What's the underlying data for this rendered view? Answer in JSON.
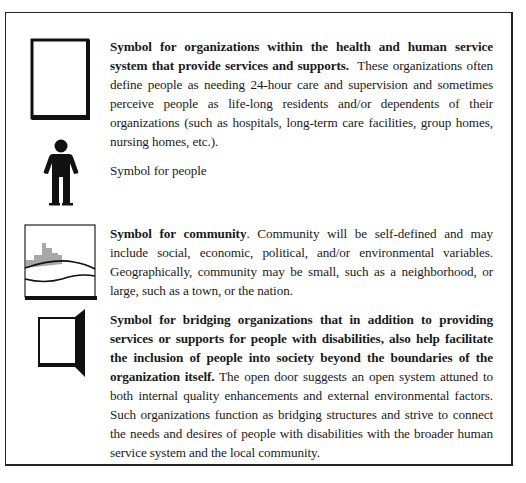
{
  "legend": {
    "entries": [
      {
        "id": "organizations",
        "icon": "organization-rectangle-icon",
        "bold": "Symbol for organizations within the health and human service system that provide services and supports.",
        "text": "  These organizations often define people as needing 24-hour care and supervision and sometimes perceive people as life-long residents and/or dependents of their organizations (such as hospitals, long-term care facilities, group homes, nursing homes, etc.)."
      },
      {
        "id": "people",
        "icon": "person-icon",
        "bold": "",
        "text": "Symbol for people"
      },
      {
        "id": "community",
        "icon": "community-landscape-icon",
        "bold": "Symbol for community",
        "text": ". Community will be self-defined and may include social, economic, political, and/or environmental variables. Geographically, community may be small, such as a neighborhood, or large, such as a town, or the nation."
      },
      {
        "id": "bridging-organizations",
        "icon": "open-door-icon",
        "bold": "Symbol for bridging organizations that in addition to providing services or supports for people with disabilities, also help facilitate the inclusion of people into society beyond the boundaries of the organization itself.",
        "text": " The open door suggests an open system attuned to both internal quality enhancements and external environmental factors. Such organizations function as bridging structures and strive to connect the needs and desires of people with disabilities with the broader human service system and the local community."
      }
    ]
  },
  "colors": {
    "ink": "#1a1a1a",
    "frame": "#222222",
    "buildings": "#a8a8a8"
  }
}
